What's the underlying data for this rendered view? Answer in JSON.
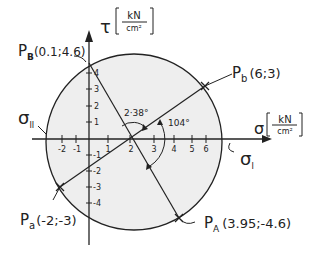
{
  "diagram": {
    "type": "mohr-circle",
    "colors": {
      "ink": "#222222",
      "fill": "#eeeeee",
      "background": "#ffffff"
    },
    "axes": {
      "sigma": {
        "symbol": "σ",
        "unit_num": "kN",
        "unit_den": "cm²"
      },
      "tau": {
        "symbol": "τ",
        "unit_num": "kN",
        "unit_den": "cm²"
      },
      "x_ticks": [
        "-2",
        "-1",
        "1",
        "2",
        "3",
        "4",
        "5",
        "6"
      ],
      "y_ticks": [
        "4",
        "3",
        "2",
        "1",
        "-1",
        "-2",
        "-3",
        "-4"
      ]
    },
    "labels": {
      "sigma_1": "σ",
      "sigma_1_sub": "I",
      "sigma_2": "σ",
      "sigma_2_sub": "II",
      "angle_2": "2·38°",
      "angle_1": "104°"
    },
    "points": {
      "pb_main": "P",
      "pb_sub": "b",
      "pb_coords": "(6;3)",
      "pa_main": "P",
      "pa_sub": "a",
      "pa_coords": "(-2;-3)",
      "pB_main": "P",
      "pB_sub": "B",
      "pB_coords": "(0.1;4.6)",
      "pA_main": "P",
      "pA_sub": "A",
      "pA_coords": "(3.95;-4.6)"
    }
  }
}
